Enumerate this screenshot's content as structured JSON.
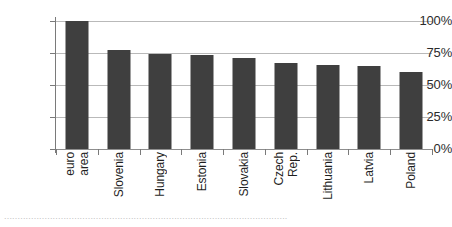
{
  "chart_data": {
    "type": "bar",
    "title": "",
    "xlabel": "",
    "ylabel": "",
    "ylim": [
      0,
      100
    ],
    "grid": true,
    "legend": "none",
    "orientation": "vertical",
    "bar_color": "#3f3f3f",
    "gridline_color": "#b9b9b9",
    "axis_color": "#7a7a7a",
    "categories": [
      "euro area",
      "Slovenia",
      "Hungary",
      "Estonia",
      "Slovakia",
      "Czech Rep.",
      "Lithuania",
      "Latvia",
      "Poland"
    ],
    "category_lines": [
      [
        "euro",
        "area"
      ],
      [
        "Slovenia"
      ],
      [
        "Hungary"
      ],
      [
        "Estonia"
      ],
      [
        "Slovakia"
      ],
      [
        "Czech",
        "Rep."
      ],
      [
        "Lithuania"
      ],
      [
        "Latvia"
      ],
      [
        "Poland"
      ]
    ],
    "values": [
      100,
      77,
      74,
      73.5,
      71,
      67,
      65.5,
      64.5,
      60
    ],
    "yticks": [
      0,
      25,
      50,
      75,
      100
    ],
    "ytick_labels": [
      "0%",
      "25%",
      "50%",
      "75%",
      "100%"
    ]
  },
  "footer": {
    "cropped_caption": "........................................................................................................."
  }
}
